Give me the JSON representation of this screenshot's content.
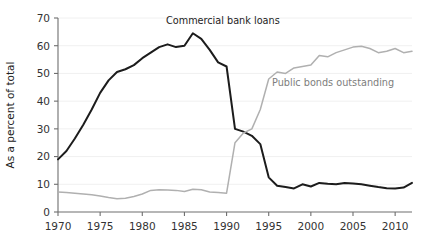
{
  "chart_data": {
    "type": "line",
    "title": "",
    "xlabel": "",
    "ylabel": "As a percent of total",
    "xlim": [
      1970,
      2012
    ],
    "ylim": [
      0,
      70
    ],
    "ytick_step": 10,
    "xtick_step": 5,
    "grid": false,
    "legend_position": "inline-annotations",
    "xticks": [
      "1970",
      "1975",
      "1980",
      "1985",
      "1990",
      "1995",
      "2000",
      "2005",
      "2010"
    ],
    "yticks": [
      "0",
      "10",
      "20",
      "30",
      "40",
      "50",
      "60",
      "70"
    ],
    "x": [
      1970,
      1971,
      1972,
      1973,
      1974,
      1975,
      1976,
      1977,
      1978,
      1979,
      1980,
      1981,
      1982,
      1983,
      1984,
      1985,
      1986,
      1987,
      1988,
      1989,
      1990,
      1991,
      1992,
      1993,
      1994,
      1995,
      1996,
      1997,
      1998,
      1999,
      2000,
      2001,
      2002,
      2003,
      2004,
      2005,
      2006,
      2007,
      2008,
      2009,
      2010,
      2011,
      2012
    ],
    "series": [
      {
        "name": "Commercial bank loans",
        "color": "#1c1c1c",
        "label_x": 1987,
        "label_y": 70,
        "values": [
          19.0,
          22.0,
          26.5,
          31.5,
          37.0,
          43.0,
          47.5,
          50.5,
          51.5,
          53.0,
          55.5,
          57.5,
          59.5,
          60.5,
          59.5,
          60.0,
          64.5,
          62.5,
          58.5,
          54.0,
          52.5,
          30.0,
          29.0,
          27.5,
          24.5,
          12.5,
          9.5,
          9.0,
          8.5,
          10.0,
          9.2,
          10.5,
          10.2,
          10.0,
          10.5,
          10.3,
          10.0,
          9.5,
          9.0,
          8.6,
          8.5,
          8.8,
          10.5
        ]
      },
      {
        "name": "Public bonds outstanding",
        "color": "#b0b0b0",
        "label_x": 1999,
        "label_y": 47,
        "values": [
          7.2,
          7.0,
          6.8,
          6.5,
          6.2,
          5.8,
          5.2,
          4.8,
          5.0,
          5.6,
          6.5,
          7.8,
          8.0,
          7.9,
          7.8,
          7.4,
          8.2,
          8.0,
          7.2,
          7.0,
          6.8,
          25.0,
          28.5,
          30.0,
          37.0,
          48.0,
          50.5,
          50.0,
          52.0,
          52.5,
          53.0,
          56.5,
          56.0,
          57.5,
          58.5,
          59.5,
          59.8,
          59.0,
          57.5,
          58.0,
          59.0,
          57.5,
          58.0
        ]
      }
    ],
    "annotations": [
      {
        "name": "commercial-bank-loans-label",
        "text": "Commercial bank loans"
      },
      {
        "name": "public-bonds-outstanding-label",
        "text": "Public bonds outstanding"
      }
    ]
  }
}
